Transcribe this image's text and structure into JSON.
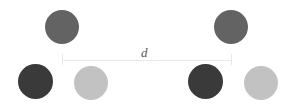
{
  "figure": {
    "name": "two-particle-clusters-separation-diagram",
    "width": 295,
    "height": 112,
    "background_color": "#ffffff"
  },
  "colors": {
    "medium_gray": "#636363",
    "dark_gray": "#3a3a3a",
    "light_gray": "#c2c2c2",
    "dimension_line": "#e8e8e8",
    "label_text": "#555555"
  },
  "dimension": {
    "label": "d",
    "label_x": 141,
    "label_y": 46,
    "label_font_size": 13,
    "line_x": 62,
    "line_y": 60,
    "line_width": 169,
    "tick_height": 11,
    "tick_top": 54
  },
  "clusters": [
    {
      "name": "left-cluster",
      "particles": [
        {
          "name": "particle-top",
          "shade": "medium",
          "color": "#636363",
          "x": 45,
          "y": 10,
          "size": 34
        },
        {
          "name": "particle-bottom-left",
          "shade": "dark",
          "color": "#3a3a3a",
          "x": 18,
          "y": 64,
          "size": 35
        },
        {
          "name": "particle-bottom-right",
          "shade": "light",
          "color": "#c2c2c2",
          "x": 74,
          "y": 66,
          "size": 34
        }
      ]
    },
    {
      "name": "right-cluster",
      "particles": [
        {
          "name": "particle-top",
          "shade": "medium",
          "color": "#636363",
          "x": 214,
          "y": 10,
          "size": 34
        },
        {
          "name": "particle-bottom-left",
          "shade": "dark",
          "color": "#3a3a3a",
          "x": 188,
          "y": 64,
          "size": 35
        },
        {
          "name": "particle-bottom-right",
          "shade": "light",
          "color": "#c2c2c2",
          "x": 244,
          "y": 66,
          "size": 34
        }
      ]
    }
  ]
}
